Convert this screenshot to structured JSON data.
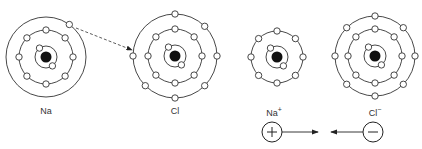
{
  "atoms": [
    {
      "label": "Na",
      "charge": "",
      "cx": 46,
      "cy": 57,
      "shells": [
        {
          "r": 11,
          "electrons": 2
        },
        {
          "r": 27,
          "electrons": 8
        },
        {
          "r": 40,
          "electrons": 1
        }
      ]
    },
    {
      "label": "Cl",
      "charge": "",
      "cx": 175,
      "cy": 56,
      "shells": [
        {
          "r": 11,
          "electrons": 2
        },
        {
          "r": 27,
          "electrons": 8
        },
        {
          "r": 42,
          "electrons": 7
        }
      ]
    },
    {
      "label": "Na",
      "charge": "+",
      "cx": 277,
      "cy": 57,
      "shells": [
        {
          "r": 11,
          "electrons": 2
        },
        {
          "r": 26,
          "electrons": 8
        }
      ]
    },
    {
      "label": "Cl",
      "charge": "−",
      "cx": 375,
      "cy": 56,
      "shells": [
        {
          "r": 11,
          "electrons": 2
        },
        {
          "r": 27,
          "electrons": 8
        },
        {
          "r": 40,
          "electrons": 8
        }
      ]
    }
  ],
  "labels": {
    "na": "Na",
    "cl": "Cl",
    "na_ion": "Na",
    "na_ion_charge": "+",
    "cl_ion": "Cl",
    "cl_ion_charge": "−"
  },
  "attraction": {
    "plus_symbol": "+",
    "minus_symbol": "−"
  }
}
